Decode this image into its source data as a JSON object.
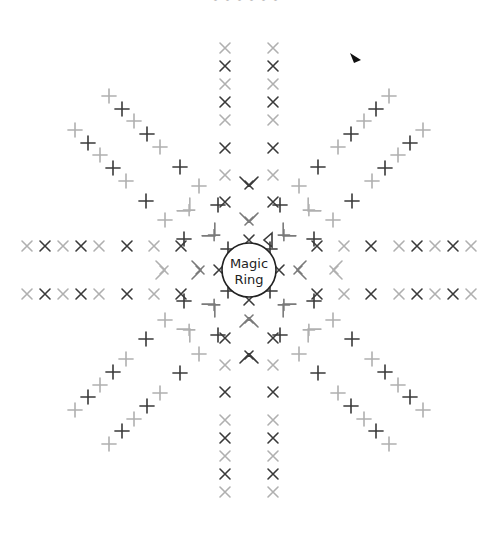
{
  "header": {
    "caption": "• • • • • •"
  },
  "center": {
    "label_line1": "Magic",
    "label_line2": "Ring",
    "x": 249,
    "y": 270,
    "r": 27
  },
  "start_marker": {
    "x": 355,
    "y": 58,
    "color": "#111111"
  },
  "colors": {
    "d": "#3a3a3a",
    "m": "#7a7a7a",
    "l": "#b0b0b0",
    "ring": "#222222"
  },
  "legend": {
    "x": "single-crochet",
    "v": "increase"
  },
  "stitches": [
    [
      279,
      270,
      0,
      "x",
      "d"
    ],
    [
      301,
      270,
      90,
      "v",
      "m"
    ],
    [
      337,
      270,
      90,
      "v",
      "l"
    ],
    [
      317,
      294,
      0,
      "x",
      "d"
    ],
    [
      344,
      294,
      0,
      "x",
      "l"
    ],
    [
      371,
      294,
      0,
      "x",
      "d"
    ],
    [
      399,
      294,
      0,
      "x",
      "l"
    ],
    [
      417,
      294,
      0,
      "x",
      "d"
    ],
    [
      435,
      294,
      0,
      "x",
      "l"
    ],
    [
      453,
      294,
      0,
      "x",
      "d"
    ],
    [
      471,
      294,
      0,
      "x",
      "l"
    ],
    [
      317,
      246,
      0,
      "x",
      "d"
    ],
    [
      344,
      246,
      0,
      "x",
      "l"
    ],
    [
      371,
      246,
      0,
      "x",
      "d"
    ],
    [
      399,
      246,
      0,
      "x",
      "l"
    ],
    [
      417,
      246,
      0,
      "x",
      "d"
    ],
    [
      435,
      246,
      0,
      "x",
      "l"
    ],
    [
      453,
      246,
      0,
      "x",
      "d"
    ],
    [
      471,
      246,
      0,
      "x",
      "l"
    ],
    [
      249,
      300,
      0,
      "x",
      "d"
    ],
    [
      249,
      322,
      180,
      "v",
      "m"
    ],
    [
      249,
      358,
      180,
      "v",
      "d"
    ],
    [
      225,
      338,
      0,
      "x",
      "d"
    ],
    [
      225,
      365,
      0,
      "x",
      "l"
    ],
    [
      225,
      392,
      0,
      "x",
      "d"
    ],
    [
      225,
      420,
      0,
      "x",
      "l"
    ],
    [
      225,
      438,
      0,
      "x",
      "d"
    ],
    [
      225,
      456,
      0,
      "x",
      "l"
    ],
    [
      225,
      474,
      0,
      "x",
      "d"
    ],
    [
      225,
      492,
      0,
      "x",
      "l"
    ],
    [
      273,
      338,
      0,
      "x",
      "d"
    ],
    [
      273,
      365,
      0,
      "x",
      "l"
    ],
    [
      273,
      392,
      0,
      "x",
      "d"
    ],
    [
      273,
      420,
      0,
      "x",
      "l"
    ],
    [
      273,
      438,
      0,
      "x",
      "d"
    ],
    [
      273,
      456,
      0,
      "x",
      "l"
    ],
    [
      273,
      474,
      0,
      "x",
      "d"
    ],
    [
      273,
      492,
      0,
      "x",
      "l"
    ],
    [
      219,
      270,
      0,
      "x",
      "d"
    ],
    [
      197,
      270,
      270,
      "v",
      "m"
    ],
    [
      161,
      270,
      270,
      "v",
      "l"
    ],
    [
      181,
      246,
      0,
      "x",
      "d"
    ],
    [
      154,
      246,
      0,
      "x",
      "l"
    ],
    [
      127,
      246,
      0,
      "x",
      "d"
    ],
    [
      99,
      246,
      0,
      "x",
      "l"
    ],
    [
      81,
      246,
      0,
      "x",
      "d"
    ],
    [
      63,
      246,
      0,
      "x",
      "l"
    ],
    [
      45,
      246,
      0,
      "x",
      "d"
    ],
    [
      27,
      246,
      0,
      "x",
      "l"
    ],
    [
      181,
      294,
      0,
      "x",
      "d"
    ],
    [
      154,
      294,
      0,
      "x",
      "l"
    ],
    [
      127,
      294,
      0,
      "x",
      "d"
    ],
    [
      99,
      294,
      0,
      "x",
      "l"
    ],
    [
      81,
      294,
      0,
      "x",
      "d"
    ],
    [
      63,
      294,
      0,
      "x",
      "l"
    ],
    [
      45,
      294,
      0,
      "x",
      "d"
    ],
    [
      27,
      294,
      0,
      "x",
      "l"
    ],
    [
      249,
      240,
      0,
      "x",
      "d"
    ],
    [
      249,
      218,
      0,
      "v",
      "m"
    ],
    [
      249,
      182,
      0,
      "v",
      "d"
    ],
    [
      273,
      202,
      0,
      "x",
      "d"
    ],
    [
      273,
      175,
      0,
      "x",
      "l"
    ],
    [
      273,
      148,
      0,
      "x",
      "d"
    ],
    [
      273,
      120,
      0,
      "x",
      "l"
    ],
    [
      273,
      102,
      0,
      "x",
      "d"
    ],
    [
      273,
      84,
      0,
      "x",
      "l"
    ],
    [
      273,
      66,
      0,
      "x",
      "d"
    ],
    [
      273,
      48,
      0,
      "x",
      "l"
    ],
    [
      225,
      202,
      0,
      "x",
      "d"
    ],
    [
      225,
      175,
      0,
      "x",
      "l"
    ],
    [
      225,
      148,
      0,
      "x",
      "d"
    ],
    [
      225,
      120,
      0,
      "x",
      "l"
    ],
    [
      225,
      102,
      0,
      "x",
      "d"
    ],
    [
      225,
      84,
      0,
      "x",
      "l"
    ],
    [
      225,
      66,
      0,
      "x",
      "d"
    ],
    [
      225,
      48,
      0,
      "x",
      "l"
    ],
    [
      270,
      291,
      45,
      "x",
      "d"
    ],
    [
      286,
      307,
      135,
      "v",
      "m"
    ],
    [
      311,
      332,
      135,
      "v",
      "l"
    ],
    [
      280,
      335,
      45,
      "x",
      "d"
    ],
    [
      299,
      354,
      45,
      "x",
      "l"
    ],
    [
      318,
      373,
      45,
      "x",
      "d"
    ],
    [
      338,
      393,
      45,
      "x",
      "l"
    ],
    [
      351,
      406,
      45,
      "x",
      "d"
    ],
    [
      364,
      419,
      45,
      "x",
      "l"
    ],
    [
      376,
      431,
      45,
      "x",
      "d"
    ],
    [
      389,
      444,
      45,
      "x",
      "l"
    ],
    [
      314,
      301,
      45,
      "x",
      "d"
    ],
    [
      333,
      320,
      45,
      "x",
      "l"
    ],
    [
      352,
      339,
      45,
      "x",
      "d"
    ],
    [
      372,
      359,
      45,
      "x",
      "l"
    ],
    [
      385,
      372,
      45,
      "x",
      "d"
    ],
    [
      398,
      385,
      45,
      "x",
      "l"
    ],
    [
      410,
      397,
      45,
      "x",
      "d"
    ],
    [
      423,
      410,
      45,
      "x",
      "l"
    ],
    [
      228,
      291,
      45,
      "x",
      "d"
    ],
    [
      212,
      307,
      225,
      "v",
      "m"
    ],
    [
      187,
      332,
      225,
      "v",
      "l"
    ],
    [
      184,
      301,
      45,
      "x",
      "d"
    ],
    [
      165,
      320,
      45,
      "x",
      "l"
    ],
    [
      146,
      339,
      45,
      "x",
      "d"
    ],
    [
      126,
      359,
      45,
      "x",
      "l"
    ],
    [
      113,
      372,
      45,
      "x",
      "d"
    ],
    [
      100,
      385,
      45,
      "x",
      "l"
    ],
    [
      88,
      397,
      45,
      "x",
      "d"
    ],
    [
      75,
      410,
      45,
      "x",
      "l"
    ],
    [
      218,
      335,
      45,
      "x",
      "d"
    ],
    [
      199,
      354,
      45,
      "x",
      "l"
    ],
    [
      180,
      373,
      45,
      "x",
      "d"
    ],
    [
      160,
      393,
      45,
      "x",
      "l"
    ],
    [
      147,
      406,
      45,
      "x",
      "d"
    ],
    [
      134,
      419,
      45,
      "x",
      "l"
    ],
    [
      122,
      431,
      45,
      "x",
      "d"
    ],
    [
      109,
      444,
      45,
      "x",
      "l"
    ],
    [
      228,
      249,
      45,
      "x",
      "d"
    ],
    [
      212,
      233,
      315,
      "v",
      "m"
    ],
    [
      187,
      208,
      315,
      "v",
      "l"
    ],
    [
      218,
      205,
      45,
      "x",
      "d"
    ],
    [
      199,
      186,
      45,
      "x",
      "l"
    ],
    [
      180,
      167,
      45,
      "x",
      "d"
    ],
    [
      160,
      147,
      45,
      "x",
      "l"
    ],
    [
      147,
      134,
      45,
      "x",
      "d"
    ],
    [
      134,
      121,
      45,
      "x",
      "l"
    ],
    [
      122,
      109,
      45,
      "x",
      "d"
    ],
    [
      109,
      96,
      45,
      "x",
      "l"
    ],
    [
      184,
      239,
      45,
      "x",
      "d"
    ],
    [
      165,
      220,
      45,
      "x",
      "l"
    ],
    [
      146,
      201,
      45,
      "x",
      "d"
    ],
    [
      126,
      181,
      45,
      "x",
      "l"
    ],
    [
      113,
      168,
      45,
      "x",
      "d"
    ],
    [
      100,
      155,
      45,
      "x",
      "l"
    ],
    [
      88,
      143,
      45,
      "x",
      "d"
    ],
    [
      75,
      130,
      45,
      "x",
      "l"
    ],
    [
      270,
      249,
      45,
      "x",
      "d"
    ],
    [
      286,
      233,
      45,
      "v",
      "m"
    ],
    [
      311,
      208,
      45,
      "v",
      "l"
    ],
    [
      314,
      239,
      45,
      "x",
      "d"
    ],
    [
      333,
      220,
      45,
      "x",
      "l"
    ],
    [
      352,
      201,
      45,
      "x",
      "d"
    ],
    [
      372,
      181,
      45,
      "x",
      "l"
    ],
    [
      385,
      168,
      45,
      "x",
      "d"
    ],
    [
      398,
      155,
      45,
      "x",
      "l"
    ],
    [
      410,
      143,
      45,
      "x",
      "d"
    ],
    [
      423,
      130,
      45,
      "x",
      "l"
    ],
    [
      280,
      205,
      45,
      "x",
      "d"
    ],
    [
      299,
      186,
      45,
      "x",
      "l"
    ],
    [
      318,
      167,
      45,
      "x",
      "d"
    ],
    [
      338,
      147,
      45,
      "x",
      "l"
    ],
    [
      351,
      134,
      45,
      "x",
      "d"
    ],
    [
      364,
      121,
      45,
      "x",
      "l"
    ],
    [
      376,
      109,
      45,
      "x",
      "d"
    ],
    [
      389,
      96,
      45,
      "x",
      "l"
    ],
    [
      268,
      240,
      0,
      "t",
      "d"
    ]
  ]
}
